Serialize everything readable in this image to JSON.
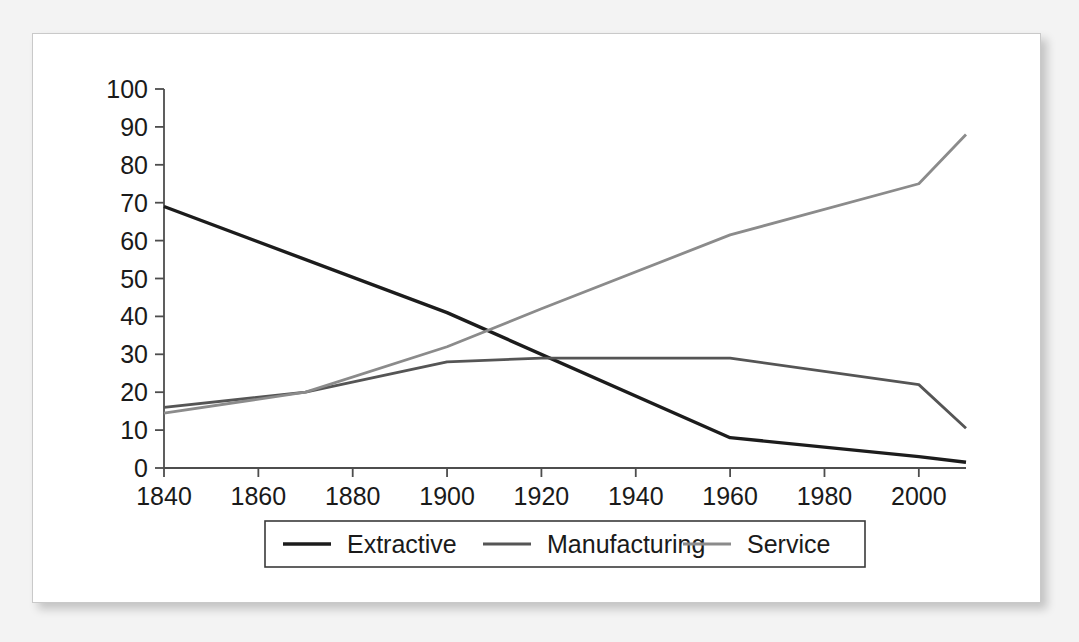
{
  "chart_data": {
    "type": "line",
    "title": "",
    "subtitle": "",
    "xlabel": "",
    "ylabel": "",
    "xlim": [
      1840,
      2010
    ],
    "ylim": [
      0,
      100
    ],
    "grid": false,
    "legend_position": "bottom-center",
    "xticks": [
      "1840",
      "1860",
      "1880",
      "1900",
      "1920",
      "1940",
      "1960",
      "1980",
      "2000"
    ],
    "xtick_values": [
      1840,
      1860,
      1880,
      1900,
      1920,
      1940,
      1960,
      1980,
      2000
    ],
    "yticks": [
      "0",
      "10",
      "20",
      "30",
      "40",
      "50",
      "60",
      "70",
      "80",
      "90",
      "100"
    ],
    "ytick_values": [
      0,
      10,
      20,
      30,
      40,
      50,
      60,
      70,
      80,
      90,
      100
    ],
    "x": [
      1840,
      1870,
      1900,
      1920,
      1960,
      2000,
      2010
    ],
    "series": [
      {
        "name": "Extractive",
        "color": "#1c1c1c",
        "width": 3.4,
        "x": [
          1840,
          1900,
          1960,
          2000,
          2010
        ],
        "values": [
          69,
          41,
          8,
          3,
          1.5
        ]
      },
      {
        "name": "Manufacturing",
        "color": "#555555",
        "width": 2.8,
        "x": [
          1840,
          1870,
          1900,
          1920,
          1960,
          2000,
          2010
        ],
        "values": [
          16,
          20,
          28,
          29,
          29,
          22,
          10.5
        ]
      },
      {
        "name": "Service",
        "color": "#8b8b8b",
        "width": 2.8,
        "x": [
          1840,
          1870,
          1900,
          1920,
          1960,
          2000,
          2010
        ],
        "values": [
          14.5,
          20,
          32,
          42,
          61.5,
          75,
          88
        ]
      }
    ],
    "legend": [
      {
        "label": "Extractive",
        "color": "#1c1c1c",
        "width": 3.4
      },
      {
        "label": "Manufacturing",
        "color": "#555555",
        "width": 2.8
      },
      {
        "label": "Service",
        "color": "#8b8b8b",
        "width": 2.8
      }
    ]
  },
  "colors": {
    "page_background": "#f3f3f3",
    "panel_background": "#ffffff",
    "panel_border": "#c9c9c9",
    "axis": "#4d4d4d",
    "text": "#1a1a1a",
    "extractive": "#1c1c1c",
    "manufacturing": "#555555",
    "service": "#8b8b8b"
  }
}
